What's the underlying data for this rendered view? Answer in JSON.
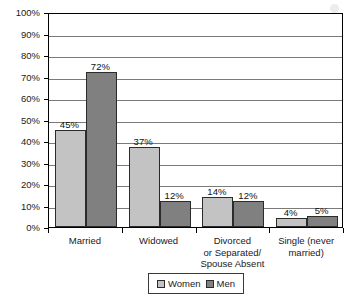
{
  "chart_data": {
    "type": "bar",
    "title": "",
    "xlabel": "",
    "ylabel": "Percent of Older Population",
    "ylim": [
      0,
      100
    ],
    "grid": true,
    "legend_position": "bottom-center",
    "categories": [
      "Married",
      "Widowed",
      "Divorced or Separated/ Spouse Absent",
      "Single (never married)"
    ],
    "category_lines": [
      [
        "Married"
      ],
      [
        "Widowed"
      ],
      [
        "Divorced",
        "or Separated/",
        "Spouse Absent"
      ],
      [
        "Single (never",
        "married)"
      ]
    ],
    "series": [
      {
        "name": "Women",
        "color": "#c3c3c3",
        "values": [
          45,
          37,
          14,
          4
        ],
        "value_labels": [
          "45%",
          "37%",
          "14%",
          "4%"
        ]
      },
      {
        "name": "Men",
        "color": "#808080",
        "values": [
          72,
          12,
          12,
          5
        ],
        "value_labels": [
          "72%",
          "12%",
          "12%",
          "5%"
        ]
      }
    ],
    "y_ticks": [
      0,
      10,
      20,
      30,
      40,
      50,
      60,
      70,
      80,
      90,
      100
    ],
    "y_tick_labels": [
      "0%",
      "10%",
      "20%",
      "30%",
      "40%",
      "50%",
      "60%",
      "70%",
      "80%",
      "90%",
      "100%"
    ]
  },
  "legend": {
    "items": [
      {
        "label": "Women",
        "color": "#c3c3c3"
      },
      {
        "label": "Men",
        "color": "#808080"
      }
    ]
  }
}
